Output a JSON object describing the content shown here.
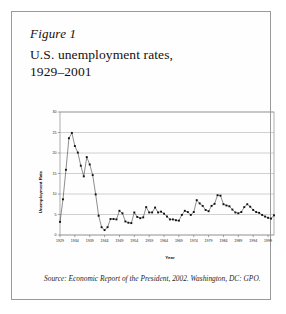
{
  "figure": {
    "label": "Figure 1",
    "title_line1": "U.S. unemployment rates,",
    "title_line2": "1929–2001",
    "source_prefix": "Source:",
    "source_text": " Economic Report of the President, 2002. Washington, DC: GPO."
  },
  "chart_data": {
    "type": "line",
    "title": "U.S. unemployment rates, 1929–2001",
    "xlabel": "Year",
    "ylabel": "Unemployment Rate",
    "xlim": [
      1929,
      2001
    ],
    "ylim": [
      0,
      30
    ],
    "ytick_step": 5,
    "yticks": [
      0,
      5,
      10,
      15,
      20,
      25,
      30
    ],
    "xticks": [
      1929,
      1934,
      1939,
      1944,
      1949,
      1954,
      1959,
      1964,
      1969,
      1974,
      1979,
      1984,
      1989,
      1994,
      1999
    ],
    "grid": "horizontal",
    "legend": "none",
    "marker": "square",
    "marker_color": "#111111",
    "line_color": "#1c1c1c",
    "grid_color": "#a8a8a8",
    "x": [
      1929,
      1930,
      1931,
      1932,
      1933,
      1934,
      1935,
      1936,
      1937,
      1938,
      1939,
      1940,
      1941,
      1942,
      1943,
      1944,
      1945,
      1946,
      1947,
      1948,
      1949,
      1950,
      1951,
      1952,
      1953,
      1954,
      1955,
      1956,
      1957,
      1958,
      1959,
      1960,
      1961,
      1962,
      1963,
      1964,
      1965,
      1966,
      1967,
      1968,
      1969,
      1970,
      1971,
      1972,
      1973,
      1974,
      1975,
      1976,
      1977,
      1978,
      1979,
      1980,
      1981,
      1982,
      1983,
      1984,
      1985,
      1986,
      1987,
      1988,
      1989,
      1990,
      1991,
      1992,
      1993,
      1994,
      1995,
      1996,
      1997,
      1998,
      1999,
      2000,
      2001
    ],
    "values": [
      3.2,
      8.7,
      15.9,
      23.6,
      24.9,
      21.7,
      20.1,
      16.9,
      14.3,
      19.0,
      17.2,
      14.6,
      9.9,
      4.7,
      1.9,
      1.2,
      1.9,
      3.9,
      3.9,
      3.8,
      5.9,
      5.3,
      3.3,
      3.0,
      2.9,
      5.5,
      4.4,
      4.1,
      4.3,
      6.8,
      5.5,
      5.5,
      6.7,
      5.5,
      5.7,
      5.2,
      4.5,
      3.8,
      3.8,
      3.6,
      3.5,
      4.9,
      5.9,
      5.6,
      4.9,
      5.6,
      8.5,
      7.7,
      7.1,
      6.1,
      5.8,
      7.1,
      7.6,
      9.7,
      9.6,
      7.5,
      7.2,
      7.0,
      6.2,
      5.5,
      5.3,
      5.6,
      6.8,
      7.5,
      6.9,
      6.1,
      5.6,
      5.4,
      4.9,
      4.5,
      4.2,
      4.0,
      4.8
    ],
    "series": [
      {
        "name": "U.S. unemployment rate",
        "values": [
          3.2,
          8.7,
          15.9,
          23.6,
          24.9,
          21.7,
          20.1,
          16.9,
          14.3,
          19.0,
          17.2,
          14.6,
          9.9,
          4.7,
          1.9,
          1.2,
          1.9,
          3.9,
          3.9,
          3.8,
          5.9,
          5.3,
          3.3,
          3.0,
          2.9,
          5.5,
          4.4,
          4.1,
          4.3,
          6.8,
          5.5,
          5.5,
          6.7,
          5.5,
          5.7,
          5.2,
          4.5,
          3.8,
          3.8,
          3.6,
          3.5,
          4.9,
          5.9,
          5.6,
          4.9,
          5.6,
          8.5,
          7.7,
          7.1,
          6.1,
          5.8,
          7.1,
          7.6,
          9.7,
          9.6,
          7.5,
          7.2,
          7.0,
          6.2,
          5.5,
          5.3,
          5.6,
          6.8,
          7.5,
          6.9,
          6.1,
          5.6,
          5.4,
          4.9,
          4.5,
          4.2,
          4.0,
          4.8
        ]
      }
    ]
  }
}
